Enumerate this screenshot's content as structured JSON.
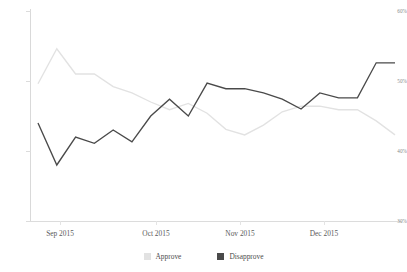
{
  "chart_data": {
    "type": "line",
    "title": "",
    "subtitle": "",
    "xlabel": "",
    "ylabel": "",
    "ylim": [
      30,
      60
    ],
    "yticks": [
      60,
      50,
      40,
      30
    ],
    "ytick_labels": [
      "60%",
      "50%",
      "40%",
      "30%"
    ],
    "grid": false,
    "legend_position": "bottom-center",
    "x": [
      "2015-08-23",
      "2015-08-30",
      "2015-09-06",
      "2015-09-13",
      "2015-09-20",
      "2015-09-27",
      "2015-10-04",
      "2015-10-11",
      "2015-10-18",
      "2015-10-25",
      "2015-11-01",
      "2015-11-08",
      "2015-11-15",
      "2015-11-22",
      "2015-11-29",
      "2015-12-06",
      "2015-12-13",
      "2015-12-20",
      "2015-12-27",
      "2016-01-03"
    ],
    "xtick_labels": [
      "Sep 2015",
      "Oct 2015",
      "Nov 2015",
      "Dec 2015"
    ],
    "xtick_positions": [
      60,
      156,
      240,
      324
    ],
    "series": [
      {
        "name": "Approve",
        "color": "#e2e2e2",
        "values": [
          49.6,
          54.6,
          51.0,
          51.0,
          49.2,
          48.3,
          47.0,
          45.9,
          46.8,
          45.4,
          43.1,
          42.3,
          43.7,
          45.6,
          46.4,
          46.4,
          45.9,
          45.9,
          44.3,
          42.3
        ]
      },
      {
        "name": "Disapprove",
        "color": "#4a4a4a",
        "values": [
          44.0,
          38.0,
          42.0,
          41.1,
          43.0,
          41.3,
          45.0,
          47.4,
          45.0,
          49.7,
          48.9,
          48.9,
          48.3,
          47.4,
          46.0,
          48.3,
          47.6,
          47.6,
          52.6,
          52.6
        ]
      }
    ]
  },
  "legend": {
    "entries": [
      {
        "label": "Approve",
        "swatch_name": "legend-swatch-approve"
      },
      {
        "label": "Disapprove",
        "swatch_name": "legend-swatch-disapprove"
      }
    ]
  },
  "colors": {
    "approve": "#e2e2e2",
    "disapprove": "#4a4a4a",
    "axis": "#dcdcdc",
    "tick_text": "#8a8a8a",
    "label_text": "#5b5b5b",
    "background": "#ffffff"
  }
}
